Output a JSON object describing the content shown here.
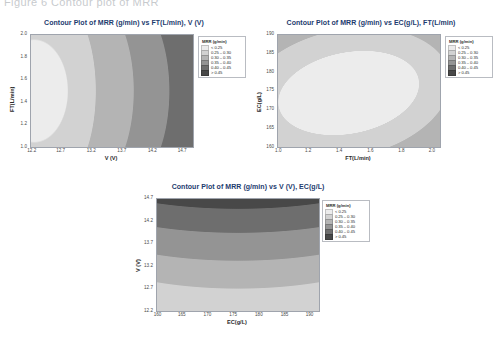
{
  "page": {
    "cut_off_heading": "Figure 6 Contour plot of MRR"
  },
  "legend": {
    "title": "MRR (g/min)",
    "colors": [
      "#ececec",
      "#d2d2d2",
      "#b4b4b4",
      "#949494",
      "#6e6e6e",
      "#484848"
    ],
    "rows": [
      {
        "swatch": "#ececec",
        "label": "<  0.25"
      },
      {
        "swatch": "#d2d2d2",
        "label": "0.25 – 0.30"
      },
      {
        "swatch": "#b4b4b4",
        "label": "0.30 – 0.35"
      },
      {
        "swatch": "#949494",
        "label": "0.35 – 0.40"
      },
      {
        "swatch": "#6e6e6e",
        "label": "0.40 – 0.45"
      },
      {
        "swatch": "#484848",
        "label": ">  0.45"
      }
    ]
  },
  "charts": [
    {
      "id": "contour-mrr-ft-v",
      "title": "Contour Plot of MRR (g/min) vs FT(L/min), V (V)",
      "xlabel": "V (V)",
      "ylabel": "FT(L/min)",
      "xticks": [
        "12.2",
        "12.7",
        "13.2",
        "13.7",
        "14.2",
        "14.7"
      ],
      "yticks": [
        "2.0",
        "1.8",
        "1.6",
        "1.4",
        "1.2",
        "1.0"
      ]
    },
    {
      "id": "contour-mrr-ec-ft",
      "title": "Contour Plot of MRR (g/min) vs EC(g/L), FT(L/min)",
      "xlabel": "FT(L/min)",
      "ylabel": "EC(g/L)",
      "xticks": [
        "1.0",
        "1.2",
        "1.4",
        "1.6",
        "1.8",
        "2.0"
      ],
      "yticks": [
        "190",
        "185",
        "180",
        "175",
        "170",
        "165",
        "160"
      ]
    },
    {
      "id": "contour-mrr-v-ec",
      "title": "Contour Plot of MRR (g/min) vs V (V), EC(g/L)",
      "xlabel": "EC(g/L)",
      "ylabel": "V (V)",
      "xticks": [
        "160",
        "165",
        "170",
        "175",
        "180",
        "185",
        "190"
      ],
      "yticks": [
        "14.7",
        "14.2",
        "13.7",
        "13.2",
        "12.7",
        "12.2"
      ]
    }
  ],
  "chart_data": [
    {
      "type": "heatmap",
      "title": "Contour Plot of MRR (g/min) vs FT(L/min), V (V)",
      "xlabel": "V (V)",
      "ylabel": "FT(L/min)",
      "xlim": [
        12.0,
        14.9
      ],
      "ylim": [
        1.0,
        2.0
      ],
      "grid": false,
      "legend_position": "right-outside",
      "legend_title": "MRR (g/min)",
      "levels": [
        0.25,
        0.3,
        0.35,
        0.4,
        0.45
      ],
      "level_labels": [
        "<  0.25",
        "0.25 – 0.30",
        "0.30 – 0.35",
        "0.35 – 0.40",
        "0.40 – 0.45",
        ">  0.45"
      ],
      "description": "MRR increases monotonically with V; vertical curved bands running bottom-left to top-right. Lowest MRR (<0.25) at far left (V~12.0), highest (>0.45) at far right (V~14.9).",
      "x": [
        12.0,
        12.2,
        12.7,
        13.2,
        13.7,
        14.2,
        14.7,
        14.9
      ],
      "grid_values": [
        [
          0.23,
          0.26,
          0.3,
          0.34,
          0.39,
          0.43,
          0.47,
          0.48
        ],
        [
          0.24,
          0.27,
          0.31,
          0.35,
          0.4,
          0.44,
          0.47,
          0.48
        ],
        [
          0.25,
          0.28,
          0.32,
          0.36,
          0.4,
          0.44,
          0.48,
          0.49
        ],
        [
          0.25,
          0.28,
          0.32,
          0.36,
          0.41,
          0.45,
          0.48,
          0.49
        ],
        [
          0.25,
          0.28,
          0.32,
          0.36,
          0.41,
          0.45,
          0.48,
          0.49
        ],
        [
          0.24,
          0.27,
          0.31,
          0.35,
          0.4,
          0.44,
          0.47,
          0.48
        ]
      ],
      "y_rows": [
        2.0,
        1.8,
        1.6,
        1.4,
        1.2,
        1.0
      ]
    },
    {
      "type": "heatmap",
      "title": "Contour Plot of MRR (g/min) vs EC(g/L), FT(L/min)",
      "xlabel": "FT(L/min)",
      "ylabel": "EC(g/L)",
      "xlim": [
        1.0,
        2.0
      ],
      "ylim": [
        160,
        190
      ],
      "grid": false,
      "legend_position": "right-outside",
      "legend_title": "MRR (g/min)",
      "levels": [
        0.25,
        0.3,
        0.35,
        0.4,
        0.45
      ],
      "level_labels": [
        "<  0.25",
        "0.25 – 0.30",
        "0.30 – 0.35",
        "0.35 – 0.40",
        "0.40 – 0.45",
        ">  0.45"
      ],
      "description": "Concentric elliptical bands with a maximum plateau (>0.45, lightest) centred near FT~1.45 L/min, EC~174 g/L. Values fall off toward all edges, darkest (<0.25) at the top-left and bottom-right corners.",
      "x": [
        1.0,
        1.2,
        1.4,
        1.6,
        1.8,
        2.0
      ],
      "y_rows": [
        190,
        185,
        180,
        175,
        170,
        165,
        160
      ],
      "grid_values": [
        [
          0.22,
          0.27,
          0.31,
          0.33,
          0.31,
          0.27
        ],
        [
          0.26,
          0.32,
          0.37,
          0.38,
          0.35,
          0.3
        ],
        [
          0.3,
          0.38,
          0.44,
          0.44,
          0.4,
          0.33
        ],
        [
          0.32,
          0.42,
          0.47,
          0.47,
          0.42,
          0.34
        ],
        [
          0.31,
          0.4,
          0.45,
          0.45,
          0.4,
          0.32
        ],
        [
          0.28,
          0.34,
          0.38,
          0.38,
          0.34,
          0.28
        ],
        [
          0.24,
          0.28,
          0.31,
          0.31,
          0.28,
          0.23
        ]
      ]
    },
    {
      "type": "heatmap",
      "title": "Contour Plot of MRR (g/min) vs V (V), EC(g/L)",
      "xlabel": "EC(g/L)",
      "ylabel": "V (V)",
      "xlim": [
        160,
        190
      ],
      "ylim": [
        12.2,
        14.9
      ],
      "grid": false,
      "legend_position": "right-outside",
      "legend_title": "MRR (g/min)",
      "levels": [
        0.25,
        0.3,
        0.35,
        0.4,
        0.45
      ],
      "level_labels": [
        "<  0.25",
        "0.25 – 0.30",
        "0.30 – 0.35",
        "0.35 – 0.40",
        "0.40 – 0.45",
        ">  0.45"
      ],
      "description": "MRR increases with V; horizontal curved bands sloping gently downward to the right. Highest MRR (>0.45) in the top band (V>14.3), lowest (<0.25) in the thin bottom band (V~12.2).",
      "x": [
        160,
        165,
        170,
        175,
        180,
        185,
        190
      ],
      "y_rows": [
        14.7,
        14.2,
        13.7,
        13.2,
        12.7,
        12.2
      ],
      "grid_values": [
        [
          0.48,
          0.48,
          0.48,
          0.47,
          0.47,
          0.46,
          0.46
        ],
        [
          0.44,
          0.44,
          0.44,
          0.43,
          0.43,
          0.42,
          0.42
        ],
        [
          0.39,
          0.39,
          0.39,
          0.38,
          0.38,
          0.37,
          0.37
        ],
        [
          0.34,
          0.34,
          0.34,
          0.33,
          0.33,
          0.32,
          0.32
        ],
        [
          0.29,
          0.29,
          0.29,
          0.28,
          0.28,
          0.27,
          0.27
        ],
        [
          0.25,
          0.25,
          0.24,
          0.24,
          0.24,
          0.23,
          0.23
        ]
      ]
    }
  ]
}
